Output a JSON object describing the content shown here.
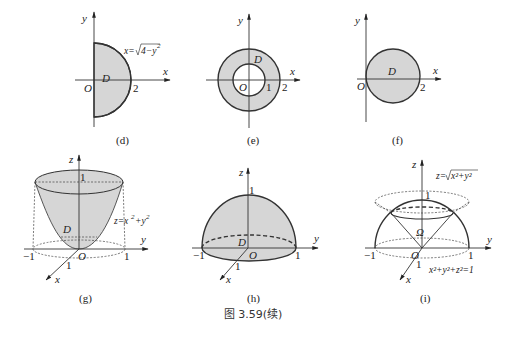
{
  "caption": "图 3.59(续)",
  "colors": {
    "region_fill": "#d6d6d6",
    "line": "#333333",
    "background": "#ffffff"
  },
  "figures": {
    "d": {
      "label": "(d)",
      "axes": {
        "x": "x",
        "y": "y"
      },
      "origin": "O",
      "region": "D",
      "tick_x": "2",
      "curve_label": "x=√(4−y²)",
      "curve_lhs": "x=",
      "curve_radicand": "4−y",
      "curve_exp": "2"
    },
    "e": {
      "label": "(e)",
      "axes": {
        "x": "x",
        "y": "y"
      },
      "origin": "O",
      "region": "D",
      "tick_inner": "1",
      "tick_outer": "2"
    },
    "f": {
      "label": "(f)",
      "axes": {
        "x": "x",
        "y": "y"
      },
      "origin": "O",
      "region": "D",
      "tick_x": "2"
    },
    "g": {
      "label": "(g)",
      "axes": {
        "x": "x",
        "y": "y",
        "z": "z"
      },
      "origin": "O",
      "region": "D",
      "tick_z": "1",
      "tick_y_neg": "−1",
      "tick_y_pos": "1",
      "tick_x": "1",
      "surface_label": "z=x²+y²",
      "surface_lhs": "z=x",
      "surface_mid": "+y",
      "surface_exp": "2"
    },
    "h": {
      "label": "(h)",
      "axes": {
        "x": "x",
        "y": "y",
        "z": "z"
      },
      "origin": "O",
      "region": "D",
      "tick_z": "1",
      "tick_y_neg": "−1",
      "tick_y_pos": "1",
      "tick_x": "1"
    },
    "i": {
      "label": "(i)",
      "axes": {
        "x": "x",
        "y": "y",
        "z": "z"
      },
      "origin": "O",
      "region": "Ω",
      "tick_z": "1",
      "tick_y_neg": "−1",
      "tick_y_pos": "1",
      "tick_x": "1",
      "cone_label": "z=√(x²+y²)",
      "cone_lhs": "z=",
      "cone_radicand": "x²+y²",
      "sphere_label": "x²+y²+z²=1"
    }
  }
}
